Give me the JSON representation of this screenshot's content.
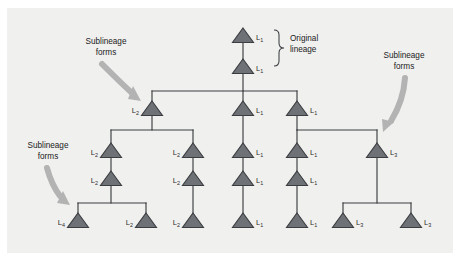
{
  "figure": {
    "type": "lineage-branching-diagram",
    "background_color": "#f0f0ef",
    "outer_color": "#ffffff",
    "triangle_fill": "#6e7277",
    "triangle_stroke": "#3b3d40",
    "line_color": "#3b3d40",
    "arrow_color": "#b3b3b3",
    "text_color": "#222222"
  },
  "annotations": {
    "original_lineage": {
      "line1": "Original",
      "line2": "lineage"
    },
    "sublineage_left_top": {
      "line1": "Sublineage",
      "line2": "forms"
    },
    "sublineage_left_bottom": {
      "line1": "Sublineage",
      "line2": "forms"
    },
    "sublineage_right": {
      "line1": "Sublineage",
      "line2": "forms"
    }
  },
  "nodes": [
    {
      "id": "n1",
      "label_base": "L",
      "label_sub": "1",
      "x": 243,
      "y": 37,
      "label_x": 256,
      "label_y": 40,
      "label_anchor": "start"
    },
    {
      "id": "n2",
      "label_base": "L",
      "label_sub": "1",
      "x": 243,
      "y": 68,
      "label_x": 256,
      "label_y": 71,
      "label_anchor": "start"
    },
    {
      "id": "n3",
      "label_base": "L",
      "label_sub": "2",
      "x": 152,
      "y": 110,
      "label_x": 139,
      "label_y": 113,
      "label_anchor": "end"
    },
    {
      "id": "n4",
      "label_base": "L",
      "label_sub": "2",
      "x": 111,
      "y": 152,
      "label_x": 98,
      "label_y": 155,
      "label_anchor": "end"
    },
    {
      "id": "n5",
      "label_base": "L",
      "label_sub": "2",
      "x": 111,
      "y": 180,
      "label_x": 98,
      "label_y": 183,
      "label_anchor": "end"
    },
    {
      "id": "n6",
      "label_base": "L",
      "label_sub": "4",
      "x": 78,
      "y": 222,
      "label_x": 65,
      "label_y": 225,
      "label_anchor": "end"
    },
    {
      "id": "n7",
      "label_base": "L",
      "label_sub": "2",
      "x": 146,
      "y": 222,
      "label_x": 133,
      "label_y": 225,
      "label_anchor": "end"
    },
    {
      "id": "n8",
      "label_base": "L",
      "label_sub": "2",
      "x": 193,
      "y": 152,
      "label_x": 180,
      "label_y": 155,
      "label_anchor": "end"
    },
    {
      "id": "n9",
      "label_base": "L",
      "label_sub": "2",
      "x": 193,
      "y": 180,
      "label_x": 180,
      "label_y": 183,
      "label_anchor": "end"
    },
    {
      "id": "n10",
      "label_base": "L",
      "label_sub": "2",
      "x": 193,
      "y": 222,
      "label_x": 180,
      "label_y": 225,
      "label_anchor": "end"
    },
    {
      "id": "n11",
      "label_base": "L",
      "label_sub": "1",
      "x": 243,
      "y": 110,
      "label_x": 256,
      "label_y": 113,
      "label_anchor": "start"
    },
    {
      "id": "n12",
      "label_base": "L",
      "label_sub": "1",
      "x": 243,
      "y": 152,
      "label_x": 256,
      "label_y": 155,
      "label_anchor": "start"
    },
    {
      "id": "n13",
      "label_base": "L",
      "label_sub": "1",
      "x": 243,
      "y": 180,
      "label_x": 256,
      "label_y": 183,
      "label_anchor": "start"
    },
    {
      "id": "n14",
      "label_base": "L",
      "label_sub": "1",
      "x": 243,
      "y": 222,
      "label_x": 256,
      "label_y": 225,
      "label_anchor": "start"
    },
    {
      "id": "n15",
      "label_base": "L",
      "label_sub": "1",
      "x": 297,
      "y": 110,
      "label_x": 310,
      "label_y": 113,
      "label_anchor": "start"
    },
    {
      "id": "n16",
      "label_base": "L",
      "label_sub": "1",
      "x": 297,
      "y": 152,
      "label_x": 310,
      "label_y": 155,
      "label_anchor": "start"
    },
    {
      "id": "n17",
      "label_base": "L",
      "label_sub": "1",
      "x": 297,
      "y": 180,
      "label_x": 310,
      "label_y": 183,
      "label_anchor": "start"
    },
    {
      "id": "n18",
      "label_base": "L",
      "label_sub": "1",
      "x": 297,
      "y": 222,
      "label_x": 310,
      "label_y": 225,
      "label_anchor": "start"
    },
    {
      "id": "n19",
      "label_base": "L",
      "label_sub": "3",
      "x": 377,
      "y": 152,
      "label_x": 390,
      "label_y": 155,
      "label_anchor": "start"
    },
    {
      "id": "n20",
      "label_base": "L",
      "label_sub": "3",
      "x": 343,
      "y": 222,
      "label_x": 356,
      "label_y": 225,
      "label_anchor": "start"
    },
    {
      "id": "n21",
      "label_base": "L",
      "label_sub": "3",
      "x": 411,
      "y": 222,
      "label_x": 424,
      "label_y": 225,
      "label_anchor": "start"
    }
  ],
  "connectors": [
    {
      "id": "stem-root-top",
      "d": "M243,40 L243,62"
    },
    {
      "id": "stem-root-down",
      "d": "M243,71 L243,91"
    },
    {
      "id": "split-level-1",
      "d": "M152,91 L297,91"
    },
    {
      "id": "drop-l2",
      "d": "M152,91 L152,104"
    },
    {
      "id": "drop-mid-1",
      "d": "M243,91 L243,104"
    },
    {
      "id": "drop-right-1",
      "d": "M297,91 L297,104"
    },
    {
      "id": "stem-l2-down",
      "d": "M152,113 L152,130"
    },
    {
      "id": "split-level-2",
      "d": "M111,130 L193,130"
    },
    {
      "id": "drop-l2-left",
      "d": "M111,130 L111,146"
    },
    {
      "id": "drop-l2-right",
      "d": "M193,130 L193,146"
    },
    {
      "id": "stem-l2a",
      "d": "M111,155 L111,174"
    },
    {
      "id": "stem-l2b",
      "d": "M111,183 L111,203"
    },
    {
      "id": "split-level-3",
      "d": "M78,203 L146,203"
    },
    {
      "id": "drop-l4",
      "d": "M78,203 L78,216"
    },
    {
      "id": "drop-l2-leaf",
      "d": "M146,203 L146,216"
    },
    {
      "id": "stem-l2c",
      "d": "M193,155 L193,174"
    },
    {
      "id": "stem-l2d",
      "d": "M193,183 L193,216"
    },
    {
      "id": "stem-mid-a",
      "d": "M243,113 L243,146"
    },
    {
      "id": "stem-mid-b",
      "d": "M243,155 L243,174"
    },
    {
      "id": "stem-mid-c",
      "d": "M243,183 L243,216"
    },
    {
      "id": "stem-r-a",
      "d": "M297,113 L297,130"
    },
    {
      "id": "split-right-2",
      "d": "M297,130 L377,130"
    },
    {
      "id": "drop-r-left",
      "d": "M297,130 L297,146"
    },
    {
      "id": "drop-r-right",
      "d": "M377,130 L377,146"
    },
    {
      "id": "stem-r-b",
      "d": "M297,155 L297,174"
    },
    {
      "id": "stem-r-c",
      "d": "M297,183 L297,216"
    },
    {
      "id": "stem-l3",
      "d": "M377,155 L377,203"
    },
    {
      "id": "split-right-3",
      "d": "M343,203 L411,203"
    },
    {
      "id": "drop-l3-left",
      "d": "M343,203 L343,216"
    },
    {
      "id": "drop-l3-right",
      "d": "M411,203 L411,216"
    }
  ]
}
